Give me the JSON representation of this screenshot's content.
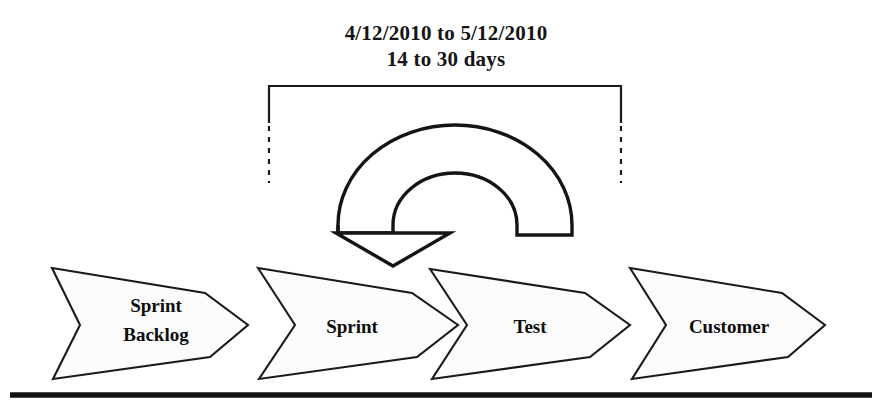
{
  "diagram": {
    "caption": {
      "line1": "4/12/2010 to 5/12/2010",
      "line2": "14 to 30 days"
    },
    "bracket": {
      "name": "sprint-duration-bracket",
      "left_x": 269,
      "right_x": 621,
      "top_y": 86,
      "solid_bottom_y": 123,
      "dashed_bottom_y": 183
    },
    "cycle_arrow": {
      "name": "sprint-cycle-arrow",
      "direction": "counter-clockwise",
      "arrowhead": "down-left"
    },
    "stages": [
      {
        "id": "sprint-backlog",
        "label_line1": "Sprint",
        "label_line2": "Backlog",
        "x_left": 52,
        "x_tip": 248,
        "center_x": 152
      },
      {
        "id": "sprint",
        "label_line1": "Sprint",
        "label_line2": "",
        "x_left": 258,
        "x_tip": 458,
        "center_x": 352
      },
      {
        "id": "test",
        "label_line1": "Test",
        "label_line2": "",
        "x_left": 430,
        "x_tip": 630,
        "center_x": 530
      },
      {
        "id": "customer",
        "label_line1": "Customer",
        "label_line2": "",
        "x_left": 630,
        "x_tip": 825,
        "center_x": 726
      }
    ],
    "baseline": {
      "name": "timeline-baseline",
      "x_start": 10,
      "x_end": 872,
      "y": 395
    },
    "colors": {
      "stroke": "#1a1a1a",
      "shape_fill": "#fcfcfc",
      "text": "#0d0d0d",
      "background": "#ffffff"
    }
  }
}
